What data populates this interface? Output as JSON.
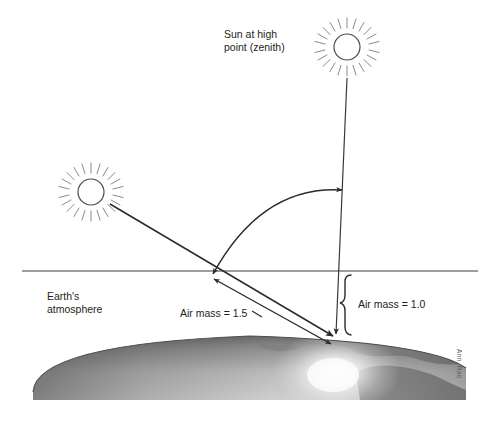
{
  "diagram": {
    "labels": {
      "zenith_sun": "Sun at high\npoint (zenith)",
      "earth_atmosphere": "Earth's\natmosphere",
      "air_mass_slant": "Air mass = 1.5",
      "air_mass_vertical": "Air mass = 1.0"
    },
    "credit": "Ann. Rao",
    "icons": {
      "zenith_sun": "sun-icon",
      "low_sun": "sun-icon"
    },
    "colors": {
      "ink": "#231f20",
      "line": "#3a3a3a",
      "earth_dark": "#6d6d6d",
      "earth_mid": "#8f8f8f",
      "earth_light": "#d8d8d8",
      "earth_glow": "#ffffff",
      "landmass": "#7c7c7c",
      "background": "#ffffff"
    },
    "geometry": {
      "atmosphere_line_y": 271,
      "zenith_sun_center": [
        347,
        47
      ],
      "low_sun_center": [
        91,
        192
      ],
      "impact_point": [
        336,
        337
      ],
      "slant_entry_point": [
        215,
        271
      ],
      "air_mass_slant_value": 1.5,
      "air_mass_vertical_value": 1.0
    }
  }
}
